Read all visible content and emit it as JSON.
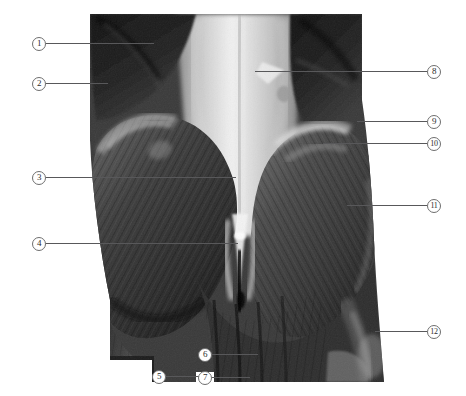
{
  "figure": {
    "kind": "anatomical-photograph",
    "view": "posterior-lower-back-gluteal",
    "rendering": "grayscale-photo",
    "background_color": "#ffffff",
    "leader_color": "#58585a",
    "circle_border_color": "#6e6e6e",
    "circle_text_color": "#2b2b2b"
  },
  "callouts": [
    {
      "number": "1",
      "side": "left",
      "circle_x": 32,
      "circle_y": 36,
      "leader_length": 108
    },
    {
      "number": "2",
      "side": "left",
      "circle_x": 32,
      "circle_y": 76,
      "leader_length": 62
    },
    {
      "number": "3",
      "side": "left",
      "circle_x": 32,
      "circle_y": 170,
      "leader_length": 190
    },
    {
      "number": "4",
      "side": "left",
      "circle_x": 32,
      "circle_y": 236,
      "leader_length": 192
    },
    {
      "number": "5",
      "side": "left",
      "circle_x": 152,
      "circle_y": 369,
      "leader_length": 36
    },
    {
      "number": "6",
      "side": "left",
      "circle_x": 198,
      "circle_y": 347,
      "leader_length": 46
    },
    {
      "number": "7",
      "side": "left",
      "circle_x": 198,
      "circle_y": 370,
      "leader_length": 38
    },
    {
      "number": "8",
      "side": "right",
      "circle_x": 427,
      "circle_y": 64,
      "leader_length": 172
    },
    {
      "number": "9",
      "side": "right",
      "circle_x": 427,
      "circle_y": 114,
      "leader_length": 70
    },
    {
      "number": "10",
      "side": "right",
      "circle_x": 427,
      "circle_y": 136,
      "leader_length": 104
    },
    {
      "number": "11",
      "side": "right",
      "circle_x": 427,
      "circle_y": 198,
      "leader_length": 80
    },
    {
      "number": "12",
      "side": "right",
      "circle_x": 427,
      "circle_y": 324,
      "leader_length": 52
    }
  ]
}
